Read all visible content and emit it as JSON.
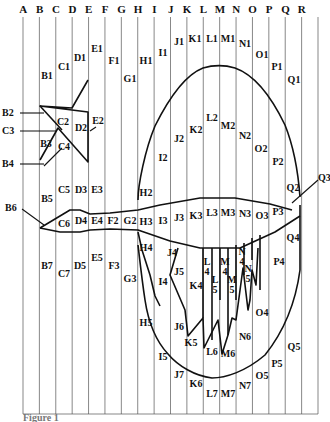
{
  "figure": {
    "caption": "Figure 1",
    "columns": [
      "A",
      "B",
      "C",
      "D",
      "E",
      "F",
      "G",
      "H",
      "I",
      "J",
      "K",
      "L",
      "M",
      "N",
      "O",
      "P",
      "Q",
      "R"
    ],
    "grid": {
      "left": 23,
      "top": 17,
      "right": 318,
      "bottom": 414,
      "stroke": "#555555"
    },
    "cell_labels": [
      {
        "t": "B1",
        "x": 47,
        "y": 79
      },
      {
        "t": "C1",
        "x": 64,
        "y": 70
      },
      {
        "t": "D1",
        "x": 80,
        "y": 61
      },
      {
        "t": "E1",
        "x": 97,
        "y": 52
      },
      {
        "t": "F1",
        "x": 114,
        "y": 64
      },
      {
        "t": "G1",
        "x": 130,
        "y": 82
      },
      {
        "t": "H1",
        "x": 146,
        "y": 64
      },
      {
        "t": "I1",
        "x": 163,
        "y": 56
      },
      {
        "t": "J1",
        "x": 179,
        "y": 45
      },
      {
        "t": "K1",
        "x": 195,
        "y": 42
      },
      {
        "t": "L1",
        "x": 212,
        "y": 42
      },
      {
        "t": "M1",
        "x": 228,
        "y": 42
      },
      {
        "t": "N1",
        "x": 245,
        "y": 47
      },
      {
        "t": "O1",
        "x": 262,
        "y": 58
      },
      {
        "t": "P1",
        "x": 277,
        "y": 70
      },
      {
        "t": "Q1",
        "x": 294,
        "y": 83
      },
      {
        "t": "L2",
        "x": 212,
        "y": 121
      },
      {
        "t": "M2",
        "x": 228,
        "y": 129
      },
      {
        "t": "K2",
        "x": 196,
        "y": 133
      },
      {
        "t": "N2",
        "x": 245,
        "y": 139
      },
      {
        "t": "J2",
        "x": 179,
        "y": 142
      },
      {
        "t": "O2",
        "x": 261,
        "y": 152
      },
      {
        "t": "P2",
        "x": 278,
        "y": 165
      },
      {
        "t": "I2",
        "x": 163,
        "y": 161
      },
      {
        "t": "E2",
        "x": 98,
        "y": 124
      },
      {
        "t": "C2",
        "x": 63,
        "y": 125
      },
      {
        "t": "D2",
        "x": 81,
        "y": 131
      },
      {
        "t": "B3",
        "x": 46,
        "y": 147
      },
      {
        "t": "C4",
        "x": 64,
        "y": 150
      },
      {
        "t": "B5",
        "x": 47,
        "y": 202
      },
      {
        "t": "C5",
        "x": 64,
        "y": 193
      },
      {
        "t": "D3",
        "x": 81,
        "y": 193
      },
      {
        "t": "E3",
        "x": 97,
        "y": 193
      },
      {
        "t": "H2",
        "x": 146,
        "y": 196
      },
      {
        "t": "Q2",
        "x": 293,
        "y": 191
      },
      {
        "t": "C6",
        "x": 64,
        "y": 227
      },
      {
        "t": "D4",
        "x": 81,
        "y": 224
      },
      {
        "t": "E4",
        "x": 97,
        "y": 224
      },
      {
        "t": "F2",
        "x": 113,
        "y": 224
      },
      {
        "t": "G2",
        "x": 130,
        "y": 224
      },
      {
        "t": "H3",
        "x": 146,
        "y": 225
      },
      {
        "t": "I3",
        "x": 163,
        "y": 224
      },
      {
        "t": "J3",
        "x": 179,
        "y": 221
      },
      {
        "t": "K3",
        "x": 196,
        "y": 219
      },
      {
        "t": "L3",
        "x": 212,
        "y": 216
      },
      {
        "t": "M3",
        "x": 228,
        "y": 216
      },
      {
        "t": "N3",
        "x": 245,
        "y": 217
      },
      {
        "t": "O3",
        "x": 262,
        "y": 219
      },
      {
        "t": "P3",
        "x": 278,
        "y": 215
      },
      {
        "t": "Q4",
        "x": 293,
        "y": 241
      },
      {
        "t": "H4",
        "x": 146,
        "y": 251
      },
      {
        "t": "J4",
        "x": 172,
        "y": 256
      },
      {
        "t": "I4",
        "x": 163,
        "y": 285
      },
      {
        "t": "J5",
        "x": 179,
        "y": 275
      },
      {
        "t": "K4",
        "x": 196,
        "y": 289
      },
      {
        "t": "P4",
        "x": 279,
        "y": 265
      },
      {
        "t": "B7",
        "x": 47,
        "y": 269
      },
      {
        "t": "C7",
        "x": 64,
        "y": 277
      },
      {
        "t": "D5",
        "x": 80,
        "y": 269
      },
      {
        "t": "E5",
        "x": 97,
        "y": 261
      },
      {
        "t": "F3",
        "x": 114,
        "y": 269
      },
      {
        "t": "G3",
        "x": 130,
        "y": 282
      },
      {
        "t": "H5",
        "x": 146,
        "y": 326
      },
      {
        "t": "I5",
        "x": 163,
        "y": 360
      },
      {
        "t": "J6",
        "x": 179,
        "y": 330
      },
      {
        "t": "K5",
        "x": 191,
        "y": 346
      },
      {
        "t": "L6",
        "x": 212,
        "y": 355
      },
      {
        "t": "M6",
        "x": 228,
        "y": 357
      },
      {
        "t": "N6",
        "x": 245,
        "y": 340
      },
      {
        "t": "O4",
        "x": 262,
        "y": 316
      },
      {
        "t": "Q5",
        "x": 294,
        "y": 350
      },
      {
        "t": "P5",
        "x": 277,
        "y": 367
      },
      {
        "t": "O5",
        "x": 262,
        "y": 379
      },
      {
        "t": "J7",
        "x": 179,
        "y": 378
      },
      {
        "t": "K6",
        "x": 196,
        "y": 387
      },
      {
        "t": "L7",
        "x": 212,
        "y": 397
      },
      {
        "t": "M7",
        "x": 228,
        "y": 397
      },
      {
        "t": "N7",
        "x": 245,
        "y": 389
      }
    ],
    "stacked_labels": [
      {
        "t1": "L",
        "t2": "4",
        "x": 207,
        "y": 265
      },
      {
        "t1": "M",
        "t2": "4",
        "x": 225,
        "y": 265
      },
      {
        "t1": "N",
        "t2": "4",
        "x": 242,
        "y": 255
      },
      {
        "t1": "L",
        "t2": "5",
        "x": 215,
        "y": 283
      },
      {
        "t1": "M",
        "t2": "5",
        "x": 232,
        "y": 283
      },
      {
        "t1": "N",
        "t2": "5",
        "x": 248,
        "y": 272
      }
    ],
    "side_labels": [
      {
        "t": "B2",
        "x": 2,
        "y": 116
      },
      {
        "t": "C3",
        "x": 2,
        "y": 134
      },
      {
        "t": "B4",
        "x": 2,
        "y": 167
      },
      {
        "t": "B6",
        "x": 5,
        "y": 211
      },
      {
        "t": "Q3",
        "x": 318,
        "y": 181
      }
    ]
  }
}
